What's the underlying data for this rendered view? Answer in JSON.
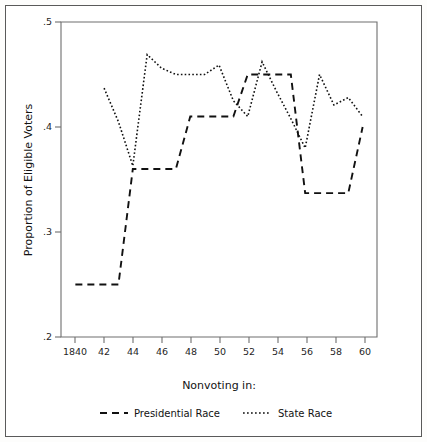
{
  "figure": {
    "background": "#ffffff",
    "frame_color": "#5a5a5a",
    "ink_color": "#111111"
  },
  "chart_data": {
    "type": "line",
    "title": "",
    "subtitle": "",
    "xlabel": "",
    "ylabel": "Proportion of Eligible Voters",
    "legend_title": "Nonvoting in:",
    "legend_position": "bottom",
    "grid": false,
    "xlim": [
      1839,
      1861
    ],
    "ylim": [
      0.2,
      0.5
    ],
    "x_tick_values": [
      1840,
      1842,
      1844,
      1846,
      1848,
      1850,
      1852,
      1854,
      1856,
      1858,
      1860
    ],
    "x_tick_labels": [
      "1840",
      "42",
      "44",
      "46",
      "48",
      "50",
      "52",
      "54",
      "56",
      "58",
      "60"
    ],
    "y_tick_values": [
      0.2,
      0.3,
      0.4,
      0.5
    ],
    "y_tick_labels": [
      ".2",
      ".3",
      ".4",
      ".5"
    ],
    "series": [
      {
        "name": "Presidential Race",
        "style": "dashed",
        "x": [
          1840,
          1842,
          1843,
          1844,
          1846,
          1847,
          1848,
          1850,
          1851,
          1852,
          1853,
          1854,
          1855,
          1856,
          1858,
          1859,
          1860
        ],
        "values": [
          0.25,
          0.25,
          0.25,
          0.36,
          0.36,
          0.36,
          0.41,
          0.41,
          0.41,
          0.45,
          0.45,
          0.45,
          0.45,
          0.337,
          0.337,
          0.337,
          0.4
        ]
      },
      {
        "name": "State Race",
        "style": "dotted",
        "x": [
          1842,
          1843,
          1844,
          1845,
          1846,
          1847,
          1848,
          1849,
          1850,
          1851,
          1852,
          1853,
          1854,
          1855,
          1856,
          1857,
          1858,
          1859,
          1860
        ],
        "values": [
          0.437,
          0.405,
          0.363,
          0.469,
          0.456,
          0.45,
          0.45,
          0.45,
          0.459,
          0.425,
          0.41,
          0.462,
          0.434,
          0.408,
          0.38,
          0.45,
          0.421,
          0.428,
          0.41
        ]
      }
    ]
  },
  "legend": {
    "title": "Nonvoting in:",
    "entries": [
      {
        "label": "Presidential Race",
        "style": "dashed"
      },
      {
        "label": "State Race",
        "style": "dotted"
      }
    ]
  },
  "axes": {
    "y_title": "Proportion of Eligible Voters"
  }
}
